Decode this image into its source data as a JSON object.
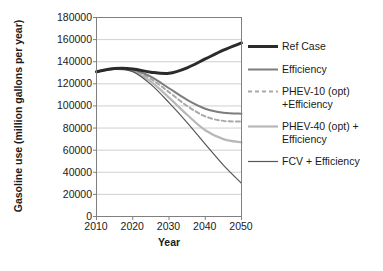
{
  "chart_data": {
    "type": "line",
    "title": "",
    "xlabel": "Year",
    "ylabel": "Gasoline use (million gallons per year)",
    "xlim": [
      2010,
      2050
    ],
    "ylim": [
      0,
      180000
    ],
    "grid": "horizontal",
    "legend_position": "right",
    "xticks": [
      "2010",
      "2020",
      "2030",
      "2040",
      "2050"
    ],
    "yticks": [
      "0",
      "20000",
      "40000",
      "60000",
      "80000",
      "100000",
      "120000",
      "140000",
      "160000",
      "180000"
    ],
    "x": [
      2010,
      2015,
      2020,
      2025,
      2030,
      2035,
      2040,
      2045,
      2050
    ],
    "series": [
      {
        "name": "Ref Case",
        "color": "#2b2b2b",
        "width": 3.0,
        "dash": "none",
        "values": [
          131000,
          133800,
          133500,
          130500,
          129500,
          134500,
          142500,
          150500,
          157000
        ]
      },
      {
        "name": "Efficiency",
        "color": "#7d7d7d",
        "width": 2.0,
        "dash": "none",
        "values": [
          131000,
          133600,
          132800,
          126500,
          116000,
          105500,
          97500,
          93800,
          93000
        ]
      },
      {
        "name": "PHEV-10 (opt)\n+Efficiency",
        "color": "#a9a9a9",
        "width": 2.0,
        "dash": "4,3",
        "values": [
          131000,
          133500,
          132300,
          124500,
          112500,
          100000,
          90500,
          86500,
          85800
        ]
      },
      {
        "name": "PHEV-40 (opt) +\nEfficiency",
        "color": "#b8b8b8",
        "width": 2.2,
        "dash": "none",
        "values": [
          131000,
          133400,
          131600,
          122000,
          107500,
          92000,
          78000,
          70000,
          67000
        ]
      },
      {
        "name": "FCV + Efficiency",
        "color": "#565656",
        "width": 1.2,
        "dash": "none",
        "values": [
          131000,
          133300,
          131000,
          119500,
          103000,
          85000,
          65500,
          46500,
          30000
        ]
      }
    ]
  },
  "legend": {
    "items": [
      {
        "label": "Ref Case"
      },
      {
        "label": "Efficiency"
      },
      {
        "label": "PHEV-10 (opt)\n+Efficiency"
      },
      {
        "label": "PHEV-40 (opt) +\nEfficiency"
      },
      {
        "label": "FCV + Efficiency"
      }
    ]
  },
  "axes": {
    "y_title": "Gasoline use (million gallons per year)",
    "x_title": "Year"
  }
}
